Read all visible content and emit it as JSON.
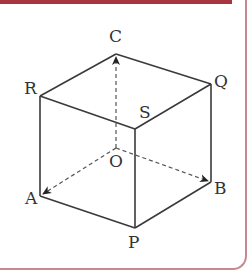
{
  "diagram": {
    "colors": {
      "frame_accent": "#a8353e",
      "frame_border": "#c8888e",
      "line": "#3a3a3a"
    },
    "vertices": {
      "C": {
        "label": "C",
        "x": 116,
        "y": 54
      },
      "R": {
        "label": "R",
        "x": 40,
        "y": 96
      },
      "Q": {
        "label": "Q",
        "x": 211,
        "y": 84
      },
      "S": {
        "label": "S",
        "x": 135,
        "y": 129
      },
      "O": {
        "label": "O",
        "x": 116,
        "y": 148
      },
      "A": {
        "label": "A",
        "x": 40,
        "y": 196
      },
      "B": {
        "label": "B",
        "x": 211,
        "y": 182
      },
      "P": {
        "label": "P",
        "x": 135,
        "y": 228
      }
    },
    "solid_edges": [
      "C-R",
      "C-Q",
      "R-S",
      "Q-S",
      "R-A",
      "S-P",
      "Q-B",
      "A-P",
      "P-B"
    ],
    "dashed_vectors": [
      "O->C",
      "O->A",
      "O->B"
    ]
  }
}
